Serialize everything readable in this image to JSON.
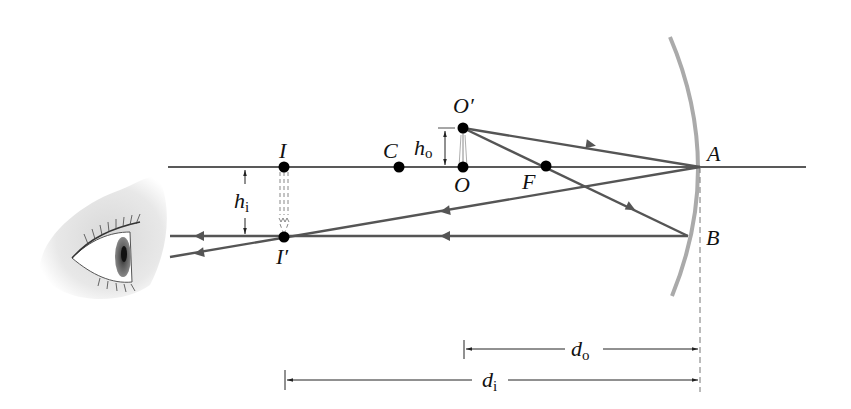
{
  "figure": {
    "colors": {
      "axis": "#222222",
      "ray": "#555555",
      "mirror": "#aaaaaa",
      "point": "#000000",
      "dashed": "#777777"
    },
    "labels": {
      "object_top": "O′",
      "object_base": "O",
      "center": "C",
      "focus": "F",
      "mirror_vertex": "A",
      "mirror_point_b": "B",
      "image_base": "I",
      "image_top": "I′",
      "h_o_main": "h",
      "h_o_sub": "o",
      "h_i_main": "h",
      "h_i_sub": "i",
      "d_o_main": "d",
      "d_o_sub": "o",
      "d_i_main": "d",
      "d_i_sub": "i"
    },
    "icons": {
      "eye": "eye-illustration"
    }
  }
}
